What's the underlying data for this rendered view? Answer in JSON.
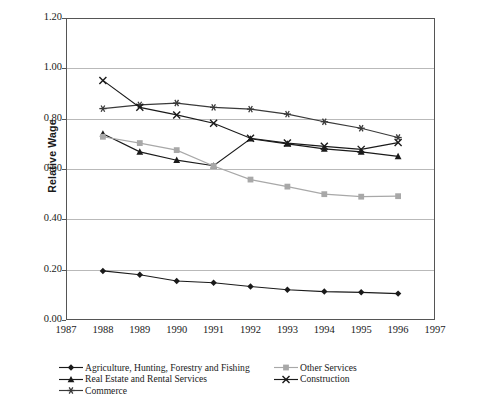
{
  "chart_data": {
    "type": "line",
    "title": "",
    "xlabel": "",
    "ylabel": "Relative Wage",
    "x": [
      1988,
      1989,
      1990,
      1991,
      1992,
      1993,
      1994,
      1995,
      1996
    ],
    "xlim": [
      1987,
      1997
    ],
    "ylim": [
      0.0,
      1.2
    ],
    "ytick_labels": [
      "0.00",
      "0.20",
      "0.40",
      "0.60",
      "0.80",
      "1.00",
      "1.20"
    ],
    "ytick_values": [
      0.0,
      0.2,
      0.4,
      0.6,
      0.8,
      1.0,
      1.2
    ],
    "xtick_labels": [
      "1987",
      "1988",
      "1989",
      "1990",
      "1991",
      "1992",
      "1993",
      "1994",
      "1995",
      "1996",
      "1997"
    ],
    "xtick_values": [
      1987,
      1988,
      1989,
      1990,
      1991,
      1992,
      1993,
      1994,
      1995,
      1996,
      1997
    ],
    "grid": "horizontal",
    "legend_position": "bottom",
    "series": [
      {
        "name": "Agriculture, Hunting, Forestry and Fishing",
        "marker": "diamond",
        "color": "#1a1a1a",
        "values": [
          0.195,
          0.18,
          0.155,
          0.148,
          0.133,
          0.12,
          0.113,
          0.11,
          0.105
        ]
      },
      {
        "name": "Real Estate and Rental Services",
        "marker": "triangle",
        "color": "#1a1a1a",
        "values": [
          0.74,
          0.668,
          0.635,
          0.613,
          0.72,
          0.7,
          0.68,
          0.668,
          0.65
        ]
      },
      {
        "name": "Commerce",
        "marker": "asterisk",
        "color": "#3a3a3a",
        "values": [
          0.84,
          0.855,
          0.862,
          0.845,
          0.838,
          0.818,
          0.788,
          0.762,
          0.725
        ]
      },
      {
        "name": "Other Services",
        "marker": "square",
        "color": "#a8a8a8",
        "values": [
          0.728,
          0.703,
          0.675,
          0.612,
          0.558,
          0.53,
          0.5,
          0.49,
          0.492
        ]
      },
      {
        "name": "Construction",
        "marker": "cross-x",
        "color": "#1a1a1a",
        "values": [
          0.952,
          0.845,
          0.815,
          0.782,
          0.722,
          0.703,
          0.69,
          0.678,
          0.705
        ]
      }
    ]
  },
  "legend": {
    "left_items": [
      "Agriculture, Hunting, Forestry and Fishing",
      "Real Estate and Rental Services",
      "Commerce"
    ],
    "right_items": [
      "Other Services",
      "Construction"
    ]
  }
}
